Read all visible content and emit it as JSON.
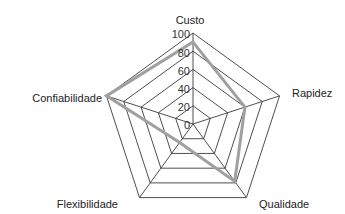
{
  "chart_data": {
    "type": "radar",
    "title": "",
    "categories": [
      "Custo",
      "Rapidez",
      "Qualidade",
      "Flexibilidade",
      "Confiabilidade"
    ],
    "series": [
      {
        "name": "Desempenho",
        "values": [
          90,
          60,
          78,
          25,
          100
        ],
        "color": "#a0a0a0"
      }
    ],
    "rlim": [
      0,
      100
    ],
    "ticks": [
      "0",
      "20",
      "40",
      "60",
      "80",
      "100"
    ],
    "grid": true,
    "legend": false
  },
  "colors": {
    "grid": "#3a3a3a",
    "series": "#a0a0a0",
    "text": "#222222"
  }
}
